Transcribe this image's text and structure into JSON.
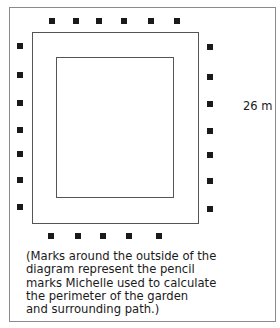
{
  "diagram": {
    "dimension_label": "26 m",
    "caption_lines": [
      "(Marks around the outside of the",
      "diagram represent the pencil",
      "marks Michelle used to calculate",
      "the perimeter of the garden",
      "and surrounding path.)"
    ],
    "shapes": {
      "outer_path_rect": {
        "x": 32,
        "y": 32,
        "w": 167,
        "h": 192
      },
      "garden_rect": {
        "x": 56,
        "y": 57,
        "w": 118,
        "h": 141
      }
    },
    "marks": {
      "top": [
        {
          "x": 49,
          "y": 18
        },
        {
          "x": 73,
          "y": 18
        },
        {
          "x": 96,
          "y": 18
        },
        {
          "x": 121,
          "y": 18
        },
        {
          "x": 148,
          "y": 18
        },
        {
          "x": 174,
          "y": 18
        }
      ],
      "left": [
        {
          "x": 17,
          "y": 43
        },
        {
          "x": 17,
          "y": 72
        },
        {
          "x": 17,
          "y": 100
        },
        {
          "x": 17,
          "y": 127
        },
        {
          "x": 17,
          "y": 151
        },
        {
          "x": 17,
          "y": 177
        },
        {
          "x": 17,
          "y": 204
        }
      ],
      "right": [
        {
          "x": 207,
          "y": 44
        },
        {
          "x": 207,
          "y": 74
        },
        {
          "x": 207,
          "y": 101
        },
        {
          "x": 207,
          "y": 128
        },
        {
          "x": 207,
          "y": 152
        },
        {
          "x": 207,
          "y": 178
        },
        {
          "x": 207,
          "y": 206
        }
      ],
      "bottom": [
        {
          "x": 48,
          "y": 233
        },
        {
          "x": 75,
          "y": 233
        },
        {
          "x": 100,
          "y": 233
        },
        {
          "x": 126,
          "y": 233
        },
        {
          "x": 156,
          "y": 233
        }
      ]
    },
    "mark_color": "#1a1a1a",
    "line_color": "#555555"
  }
}
